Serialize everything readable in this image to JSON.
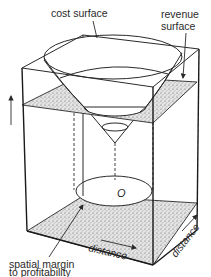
{
  "figure": {
    "labels": {
      "cost_surface": "cost surface",
      "revenue_surface_line1": "revenue",
      "revenue_surface_line2": "surface",
      "spatial_margin_line1": "spatial margin",
      "spatial_margin_line2": "to profitability",
      "distance_x": "distance",
      "distance_y": "distance",
      "origin": "O"
    },
    "elements": {
      "cost_surface": "inverted cone",
      "revenue_surface": "horizontal stippled plane",
      "base_plane": "stippled ground plane",
      "profitable_zone": "unshaded ellipse on base",
      "vertical_axis_arrow": "arrow-up-icon"
    },
    "colors": {
      "ink": "#2a2a2a",
      "background": "#ffffff"
    }
  }
}
